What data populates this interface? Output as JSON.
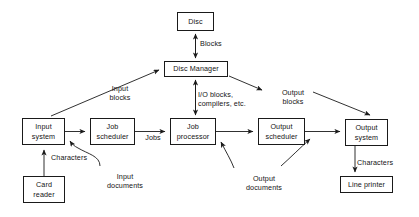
{
  "diagram": {
    "stroke_color": "#1a1a1a",
    "text_color": "#141414",
    "background_color": "#ffffff",
    "nodes": [
      {
        "id": "disc",
        "label": "Disc",
        "x": 177,
        "y": 12,
        "w": 37,
        "h": 19
      },
      {
        "id": "disc-manager",
        "label": "Disc Manager",
        "x": 164,
        "y": 61,
        "w": 64,
        "h": 16
      },
      {
        "id": "input-system",
        "label": "Input\nsystem",
        "x": 22,
        "y": 118,
        "w": 43,
        "h": 27
      },
      {
        "id": "job-scheduler",
        "label": "Job\nscheduler",
        "x": 90,
        "y": 118,
        "w": 45,
        "h": 27
      },
      {
        "id": "job-processor",
        "label": "Job\nprocessor",
        "x": 170,
        "y": 118,
        "w": 46,
        "h": 27
      },
      {
        "id": "output-scheduler",
        "label": "Output\nscheduler",
        "x": 258,
        "y": 118,
        "w": 47,
        "h": 27
      },
      {
        "id": "output-system",
        "label": "Output\nsystem",
        "x": 345,
        "y": 119,
        "w": 43,
        "h": 27
      },
      {
        "id": "card-reader",
        "label": "Card\nreader",
        "x": 23,
        "y": 176,
        "w": 42,
        "h": 27
      },
      {
        "id": "line-printer",
        "label": "Line printer",
        "x": 340,
        "y": 176,
        "w": 53,
        "h": 17
      }
    ],
    "edge_labels": [
      {
        "id": "blocks",
        "text": "Blocks",
        "x": 200,
        "y": 39,
        "w": 40,
        "align": "left"
      },
      {
        "id": "input-blocks",
        "text": "Input\nblocks",
        "x": 100,
        "y": 84,
        "w": 40,
        "align": "center"
      },
      {
        "id": "io-blocks",
        "text": "I/O blocks,\ncompilers, etc.",
        "x": 198,
        "y": 90,
        "w": 58,
        "align": "left"
      },
      {
        "id": "output-blocks",
        "text": "Output\nblocks",
        "x": 273,
        "y": 88,
        "w": 40,
        "align": "center"
      },
      {
        "id": "jobs",
        "text": "Jobs",
        "x": 139,
        "y": 133,
        "w": 28,
        "align": "center"
      },
      {
        "id": "characters-input",
        "text": "Characters",
        "x": 51,
        "y": 153,
        "w": 46,
        "align": "left"
      },
      {
        "id": "input-documents",
        "text": "Input\ndocuments",
        "x": 98,
        "y": 172,
        "w": 54,
        "align": "center"
      },
      {
        "id": "output-documents",
        "text": "Output\ndocuments",
        "x": 236,
        "y": 174,
        "w": 56,
        "align": "center"
      },
      {
        "id": "characters-output",
        "text": "Characters",
        "x": 357,
        "y": 158,
        "w": 48,
        "align": "left"
      }
    ],
    "edges": [
      {
        "id": "disc-to-manager-up",
        "from": "disc-manager",
        "to": "disc",
        "kind": "straight-vertical",
        "arrows": "both"
      },
      {
        "id": "input-to-manager",
        "from": "input-system",
        "to": "disc-manager",
        "kind": "diagonal",
        "arrows": "end"
      },
      {
        "id": "manager-to-processor",
        "from": "disc-manager",
        "to": "job-processor",
        "kind": "straight-vertical",
        "arrows": "both"
      },
      {
        "id": "manager-to-output",
        "from": "disc-manager",
        "to": "output-system",
        "kind": "diagonal",
        "arrows": "end"
      },
      {
        "id": "input-to-scheduler",
        "from": "input-system",
        "to": "job-scheduler",
        "kind": "horizontal",
        "arrows": "end"
      },
      {
        "id": "scheduler-to-processor",
        "from": "job-scheduler",
        "to": "job-processor",
        "kind": "horizontal",
        "arrows": "end"
      },
      {
        "id": "processor-to-outsched",
        "from": "job-processor",
        "to": "output-scheduler",
        "kind": "horizontal",
        "arrows": "end"
      },
      {
        "id": "outsched-to-outsys",
        "from": "output-scheduler",
        "to": "output-system",
        "kind": "horizontal",
        "arrows": "end"
      },
      {
        "id": "reader-to-input",
        "from": "card-reader",
        "to": "input-system",
        "kind": "straight-vertical",
        "arrows": "end"
      },
      {
        "id": "outsys-to-printer",
        "from": "output-system",
        "to": "line-printer",
        "kind": "straight-vertical",
        "arrows": "end"
      },
      {
        "id": "inputdocs-curve",
        "from": "input-documents",
        "to": "input-system",
        "kind": "curve",
        "arrows": "end"
      },
      {
        "id": "outputdocs-curve-1",
        "from": "output-documents",
        "to": "job-processor",
        "kind": "curve",
        "arrows": "end"
      },
      {
        "id": "outputdocs-curve-2",
        "from": "output-documents",
        "to": "output-system",
        "kind": "curve",
        "arrows": "end"
      }
    ]
  }
}
